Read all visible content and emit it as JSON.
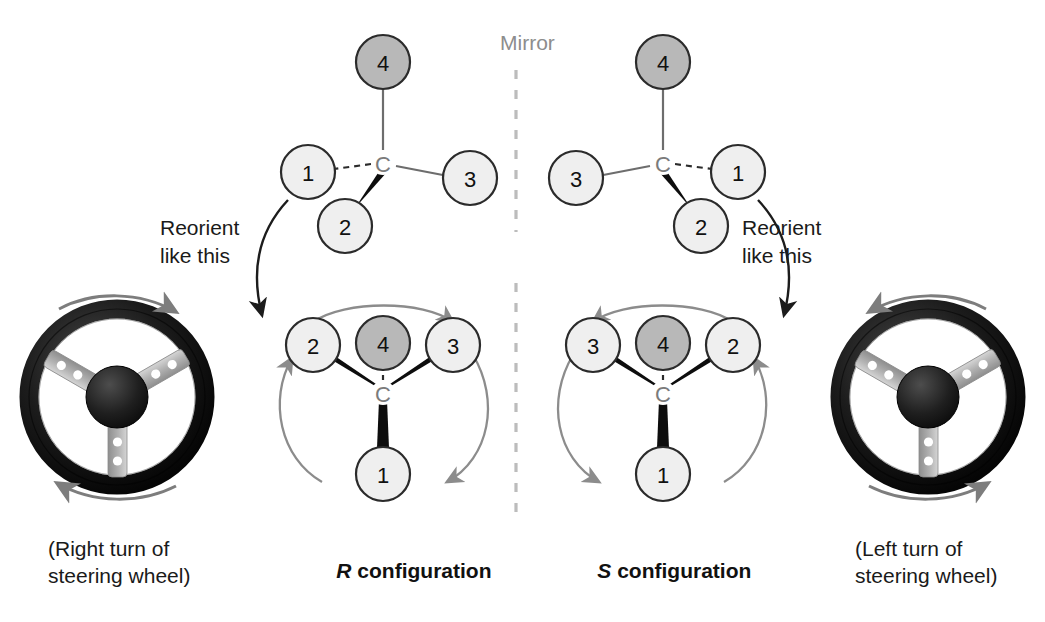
{
  "figure": {
    "mirror_label": "Mirror",
    "colors": {
      "node_light_fill": "#efefef",
      "node_dark_fill": "#b8b8b8",
      "node_stroke": "#2b2b2b",
      "bond_plain": "#6d6d6d",
      "bond_wedge": "#0d0d0d",
      "rotation_arrow": "#8c8c8c",
      "reorient_arrow": "#1c1c1c",
      "mirror_line": "#bcbcbc",
      "wheel_rim": "#101010",
      "wheel_spoke": "#b9b9b9",
      "wheel_hub": "#1a1a1a",
      "wheel_arrow": "#7d7d7d",
      "carbon_text": "#7b7b7b",
      "background": "#ffffff"
    }
  },
  "left_panel": {
    "config_label_prefix": "R",
    "config_label_suffix": " configuration",
    "reorient_label_line1": "Reorient",
    "reorient_label_line2": "like this",
    "wheel_caption_line1": "(Right turn of",
    "wheel_caption_line2": "steering wheel)",
    "wheel_turn_direction": "clockwise",
    "tetrahedral": {
      "center_label": "C",
      "substituents": [
        {
          "label": "4",
          "position": "top",
          "bond": "plain",
          "shade": "dark"
        },
        {
          "label": "1",
          "position": "left",
          "bond": "dashed",
          "shade": "light"
        },
        {
          "label": "3",
          "position": "right",
          "bond": "plain",
          "shade": "light"
        },
        {
          "label": "2",
          "position": "bottom",
          "bond": "wedge",
          "shade": "light"
        }
      ]
    },
    "reoriented": {
      "center_label": "C",
      "substituents": [
        {
          "label": "2",
          "position": "upper-left",
          "bond": "wedge",
          "shade": "light"
        },
        {
          "label": "4",
          "position": "top-center",
          "bond": "dashed",
          "shade": "dark"
        },
        {
          "label": "3",
          "position": "upper-right",
          "bond": "wedge",
          "shade": "light"
        },
        {
          "label": "1",
          "position": "bottom",
          "bond": "wedge",
          "shade": "light"
        }
      ],
      "rotation_sequence": [
        "2",
        "3",
        "1"
      ],
      "rotation_direction": "clockwise"
    }
  },
  "right_panel": {
    "config_label_prefix": "S",
    "config_label_suffix": " configuration",
    "reorient_label_line1": "Reorient",
    "reorient_label_line2": "like this",
    "wheel_caption_line1": "(Left turn of",
    "wheel_caption_line2": "steering wheel)",
    "wheel_turn_direction": "counterclockwise",
    "tetrahedral": {
      "center_label": "C",
      "substituents": [
        {
          "label": "4",
          "position": "top",
          "bond": "plain",
          "shade": "dark"
        },
        {
          "label": "3",
          "position": "left",
          "bond": "plain",
          "shade": "light"
        },
        {
          "label": "1",
          "position": "right",
          "bond": "dashed",
          "shade": "light"
        },
        {
          "label": "2",
          "position": "bottom",
          "bond": "wedge",
          "shade": "light"
        }
      ]
    },
    "reoriented": {
      "center_label": "C",
      "substituents": [
        {
          "label": "3",
          "position": "upper-left",
          "bond": "wedge",
          "shade": "light"
        },
        {
          "label": "4",
          "position": "top-center",
          "bond": "dashed",
          "shade": "dark"
        },
        {
          "label": "2",
          "position": "upper-right",
          "bond": "wedge",
          "shade": "light"
        },
        {
          "label": "1",
          "position": "bottom",
          "bond": "wedge",
          "shade": "light"
        }
      ],
      "rotation_sequence": [
        "2",
        "3",
        "1"
      ],
      "rotation_direction": "counterclockwise"
    }
  }
}
